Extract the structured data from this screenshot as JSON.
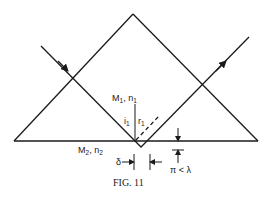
{
  "figure": {
    "caption": "FIG. 11",
    "labels": {
      "medium1": {
        "name": "M",
        "sub": "1",
        "sep": ", ",
        "index": "n",
        "index_sub": "1"
      },
      "medium2": {
        "name": "M",
        "sub": "2",
        "sep": ", ",
        "index": "n",
        "index_sub": "2"
      },
      "incidence_angle": {
        "text": "i",
        "sub": "1"
      },
      "reflection_angle": {
        "text": "r",
        "sub": "1"
      },
      "shift": "δ",
      "penetration": "π < λ"
    },
    "colors": {
      "ink": "#1a1a1a",
      "background": "#ffffff"
    }
  }
}
